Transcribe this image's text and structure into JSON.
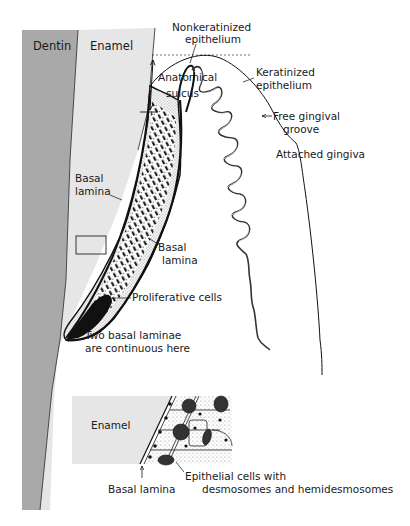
{
  "figure": {
    "colors": {
      "dentin": "#a9a9a9",
      "enamel": "#e6e6e6",
      "ink": "#111111",
      "background": "#ffffff"
    }
  },
  "main_diagram": {
    "regions": {
      "dentin": "Dentin",
      "enamel": "Enamel"
    },
    "labels": {
      "nonkeratinized_line1": "Nonkeratinized",
      "nonkeratinized_line2": "epithelium",
      "anatomical_line1": "Anatomical",
      "anatomical_line2": "sulcus",
      "keratinized_line1": "Keratinized",
      "keratinized_line2": "epithelium",
      "free_groove_line1": "Free gingival",
      "free_groove_line2": "groove",
      "attached_gingiva": "Attached gingiva",
      "basal_lamina_inner_line1": "Basal",
      "basal_lamina_inner_line2": "lamina",
      "basal_lamina_outer_line1": "Basal",
      "basal_lamina_outer_line2": "lamina",
      "proliferative": "Proliferative cells",
      "continuous_line1": "Two basal laminae",
      "continuous_line2": "are continuous here"
    }
  },
  "inset_diagram": {
    "labels": {
      "enamel": "Enamel",
      "basal_lamina": "Basal lamina",
      "epithelial_line1": "Epithelial cells with",
      "epithelial_line2": "desmosomes and hemidesmosomes"
    }
  }
}
